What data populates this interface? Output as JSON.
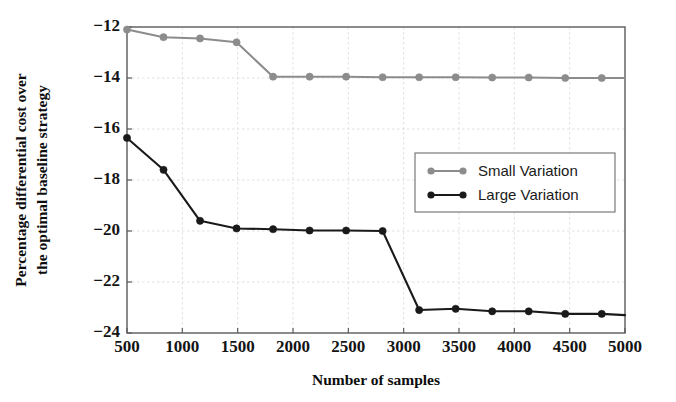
{
  "chart_data": {
    "type": "line",
    "title": "",
    "xlabel": "Number of samples",
    "ylabel": "Percentage differential cost over the optimal baseline strategy",
    "ylabel_line1": "Percentage differential cost over",
    "ylabel_line2": "the optimal baseline strategy",
    "xlim": [
      500,
      5000
    ],
    "ylim": [
      -24,
      -12
    ],
    "xticks": [
      500,
      1000,
      1500,
      2000,
      2500,
      3000,
      3500,
      4000,
      4500,
      5000
    ],
    "xticklabels": [
      "500",
      "1000",
      "1500",
      "2000",
      "2500",
      "3000",
      "3500",
      "4000",
      "4500",
      "5000"
    ],
    "yticks": [
      -24,
      -22,
      -20,
      -18,
      -16,
      -14,
      -12
    ],
    "yticklabels": [
      "−24",
      "−22",
      "−20",
      "−18",
      "−16",
      "−14",
      "−12"
    ],
    "grid": true,
    "legend_position": "center-right",
    "x": [
      500,
      830,
      1160,
      1490,
      1820,
      2150,
      2480,
      2810,
      3140,
      3470,
      3800,
      4130,
      4460,
      4790,
      5000
    ],
    "series": [
      {
        "name": "Small Variation",
        "color": "#8c8c8c",
        "marker": "circle",
        "values": [
          -12.1,
          -12.4,
          -12.45,
          -12.6,
          -13.95,
          -13.95,
          -13.95,
          -13.97,
          -13.97,
          -13.97,
          -13.98,
          -13.98,
          -14.0,
          -14.0,
          -14.0
        ]
      },
      {
        "name": "Large Variation",
        "color": "#1a1a1a",
        "marker": "circle",
        "values": [
          -16.35,
          -17.6,
          -19.6,
          -19.9,
          -19.93,
          -19.98,
          -19.98,
          -20.0,
          -23.1,
          -23.05,
          -23.15,
          -23.15,
          -23.25,
          -23.25,
          -23.3
        ]
      }
    ],
    "legend": [
      {
        "label": "Small Variation",
        "color": "#8c8c8c"
      },
      {
        "label": "Large Variation",
        "color": "#1a1a1a"
      }
    ]
  }
}
